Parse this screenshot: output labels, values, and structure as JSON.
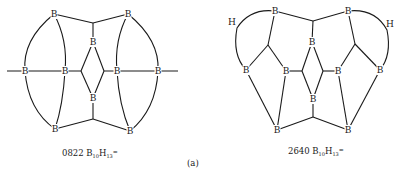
{
  "figure": {
    "panel_label": "(a)",
    "structures": [
      {
        "id": "left",
        "caption": {
          "code": "0822",
          "formula_base1": "B",
          "sub1": "10",
          "formula_base2": "H",
          "sub2": "13",
          "charge": "="
        },
        "atom_label": "B"
      },
      {
        "id": "right",
        "caption": {
          "code": "2640",
          "formula_base1": "B",
          "sub1": "10",
          "formula_base2": "H",
          "sub2": "13",
          "charge": "="
        },
        "atom_label": "B",
        "bridge_label": "H"
      }
    ]
  }
}
